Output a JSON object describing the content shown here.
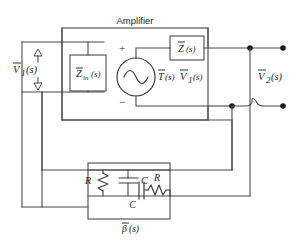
{
  "figure": {
    "background_color": "#ffffff",
    "line_color": "#4a4a4a"
  },
  "amplifier": {
    "label": "Amplifier",
    "input_impedance_label": "Z",
    "input_impedance_subscript": "in",
    "input_impedance_arg": "(s)",
    "series_impedance_label": "Z",
    "series_impedance_arg": "(s)",
    "source_label_t": "T",
    "source_label_t_arg": "(s)",
    "source_label_v": "V",
    "source_label_v_subscript": "1",
    "source_label_v_arg": "(s)",
    "plus_sign": "+",
    "minus_sign": "−"
  },
  "ports": {
    "input_label": "V",
    "input_subscript": "1",
    "input_arg": "(s)",
    "output_label": "V",
    "output_subscript": "2",
    "output_arg": "(s)"
  },
  "feedback": {
    "label": "β",
    "label_arg": "(s)",
    "components": [
      {
        "name": "R",
        "kind": "resistor",
        "orientation": "vertical",
        "position": "shunt-left"
      },
      {
        "name": "C",
        "kind": "capacitor",
        "orientation": "horizontal",
        "position": "shunt-left-parallel"
      },
      {
        "name": "C",
        "kind": "capacitor",
        "orientation": "vertical",
        "position": "series-right"
      },
      {
        "name": "R",
        "kind": "resistor",
        "orientation": "horizontal",
        "position": "series-right"
      }
    ]
  }
}
